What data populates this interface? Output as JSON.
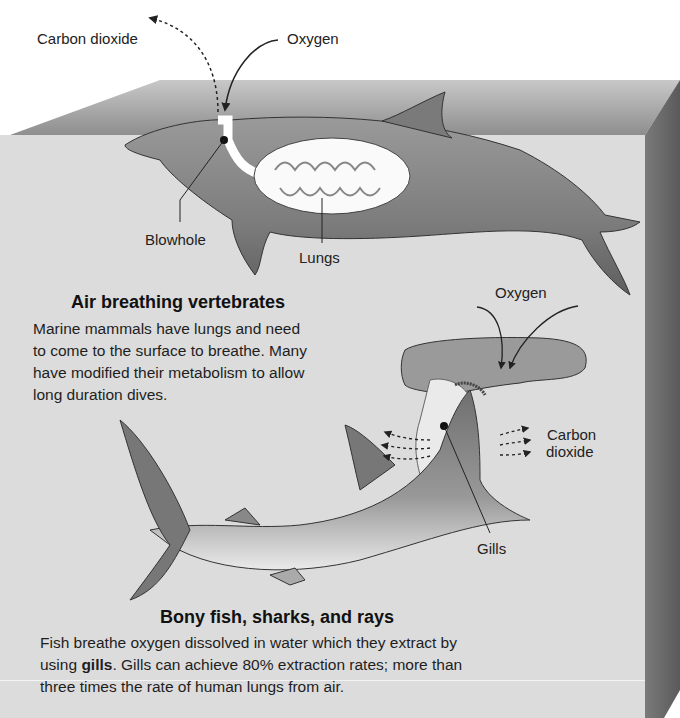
{
  "labels": {
    "co2_top": "Carbon dioxide",
    "oxygen_top": "Oxygen",
    "blowhole": "Blowhole",
    "lungs": "Lungs",
    "oxygen_shark": "Oxygen",
    "co2_shark_line1": "Carbon",
    "co2_shark_line2": "dioxide",
    "gills": "Gills"
  },
  "sections": {
    "air": {
      "heading": "Air breathing vertebrates",
      "lines": [
        "Marine mammals have lungs and need",
        "to come to the surface to breathe. Many",
        "have modified their metabolism to allow",
        "long duration dives."
      ]
    },
    "fish": {
      "heading": "Bony fish, sharks, and rays",
      "line1": "Fish breathe oxygen dissolved in water which they extract by",
      "line2_pre": "using ",
      "line2_bold": "gills",
      "line2_post": ". Gills can achieve 80% extraction rates; more than",
      "line3": "three times the rate of human lungs from air."
    }
  },
  "colors": {
    "water_front": "#d9d9d9",
    "water_top": "#9a9a9a",
    "water_side": "#6e6e6e",
    "animal_dark": "#7d7d7d",
    "animal_light": "#eeeeee"
  }
}
